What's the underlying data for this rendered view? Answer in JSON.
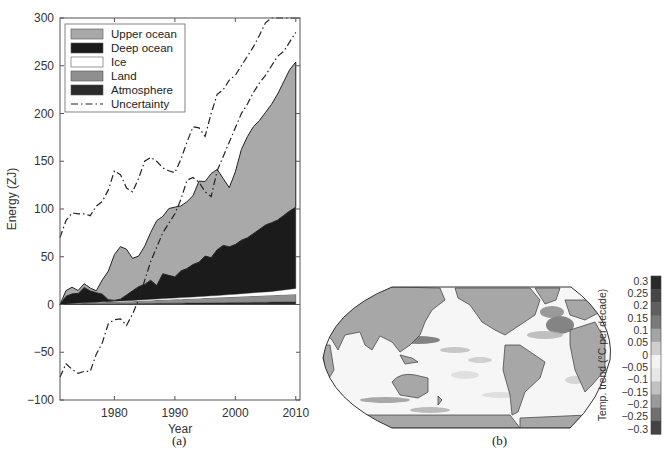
{
  "chart_data": [
    {
      "id": "a",
      "type": "area",
      "caption": "(a)",
      "title": "",
      "xlabel": "Year",
      "ylabel": "Energy (ZJ)",
      "xlim": [
        1971,
        2010.7
      ],
      "ylim": [
        -100,
        300
      ],
      "xticks": [
        1980,
        1990,
        2000,
        2010
      ],
      "yticks": [
        -100,
        -50,
        0,
        50,
        100,
        150,
        200,
        250,
        300
      ],
      "grid": false,
      "legend_position": "upper left",
      "legend": [
        "Upper ocean",
        "Deep ocean",
        "Ice",
        "Land",
        "Atmosphere",
        "Uncertainty"
      ],
      "x": [
        1971,
        1972,
        1973,
        1974,
        1975,
        1976,
        1977,
        1978,
        1979,
        1980,
        1981,
        1982,
        1983,
        1984,
        1985,
        1986,
        1987,
        1988,
        1989,
        1990,
        1991,
        1992,
        1993,
        1994,
        1995,
        1996,
        1997,
        1998,
        1999,
        2000,
        2001,
        2002,
        2003,
        2004,
        2005,
        2006,
        2007,
        2008,
        2009,
        2010
      ],
      "stacking": "cumulative (Atmosphere, Land, Ice, Deep ocean, Upper ocean from bottom)",
      "series": [
        {
          "name": "Atmosphere",
          "color": "#2a2a2a",
          "values": [
            0,
            0.2,
            0.3,
            0.4,
            0.4,
            0.5,
            0.5,
            0.6,
            0.6,
            0.7,
            0.8,
            0.8,
            0.9,
            1,
            1,
            1.1,
            1.2,
            1.3,
            1.3,
            1.4,
            1.4,
            1.5,
            1.5,
            1.6,
            1.7,
            1.8,
            1.8,
            1.9,
            2,
            2,
            2.1,
            2.2,
            2.3,
            2.3,
            2.4,
            2.5,
            2.5,
            2.6,
            2.7,
            2.8
          ]
        },
        {
          "name": "Land",
          "color": "#8f8f8f",
          "values": [
            0,
            0.3,
            0.6,
            0.9,
            1.1,
            1.3,
            1.5,
            1.7,
            1.9,
            2,
            2.2,
            2.4,
            2.6,
            2.8,
            3,
            3.2,
            3.4,
            3.6,
            3.8,
            4,
            4.2,
            4.4,
            4.6,
            4.8,
            5,
            5.2,
            5.4,
            5.6,
            5.8,
            6,
            6.2,
            6.4,
            6.6,
            6.8,
            7,
            7.2,
            7.4,
            7.6,
            7.8,
            8
          ]
        },
        {
          "name": "Ice",
          "color": "#ffffff",
          "values": [
            0,
            0.1,
            0.2,
            0.3,
            0.3,
            0.4,
            0.4,
            0.5,
            0.5,
            0.6,
            0.6,
            0.7,
            0.8,
            0.9,
            1,
            1.1,
            1.2,
            1.3,
            1.4,
            1.5,
            1.6,
            1.7,
            1.8,
            1.9,
            2,
            2.1,
            2.2,
            2.4,
            2.6,
            2.8,
            3,
            3.2,
            3.4,
            3.6,
            3.8,
            4,
            4.5,
            5,
            5.5,
            6
          ]
        },
        {
          "name": "Deep ocean",
          "color": "#1b1b1b",
          "values": [
            0,
            8,
            10,
            10,
            16,
            12,
            10,
            8,
            2,
            1,
            2,
            6,
            10,
            14,
            16,
            20,
            14,
            26,
            24,
            22,
            28,
            30,
            34,
            36,
            42,
            40,
            48,
            52,
            50,
            52,
            56,
            58,
            62,
            66,
            70,
            72,
            74,
            78,
            82,
            85
          ]
        },
        {
          "name": "Upper ocean",
          "color": "#a9a9a9",
          "values": [
            0,
            6,
            7,
            3,
            4,
            3,
            2,
            15,
            30,
            48,
            55,
            48,
            34,
            32,
            40,
            50,
            68,
            60,
            70,
            73,
            68,
            70,
            72,
            85,
            78,
            88,
            84,
            70,
            62,
            76,
            95,
            106,
            112,
            114,
            118,
            124,
            132,
            140,
            148,
            152
          ]
        },
        {
          "name": "Uncertainty (upper)",
          "style": "dash-dot",
          "color": "#222222",
          "values": [
            70,
            88,
            96,
            95,
            95,
            93,
            103,
            108,
            120,
            140,
            136,
            122,
            118,
            132,
            150,
            154,
            150,
            143,
            140,
            138,
            152,
            170,
            186,
            185,
            176,
            200,
            220,
            225,
            235,
            240,
            250,
            260,
            270,
            282,
            295,
            300,
            300,
            300,
            300,
            300
          ]
        },
        {
          "name": "Uncertainty (lower)",
          "style": "dash-dot",
          "color": "#222222",
          "values": [
            -76,
            -62,
            -68,
            -72,
            -70,
            -70,
            -52,
            -40,
            -20,
            -16,
            -15,
            -22,
            -10,
            5,
            25,
            45,
            60,
            75,
            85,
            95,
            110,
            130,
            133,
            128,
            118,
            113,
            140,
            155,
            170,
            185,
            200,
            210,
            222,
            232,
            240,
            250,
            260,
            265,
            275,
            285
          ]
        }
      ]
    },
    {
      "id": "b",
      "type": "heatmap",
      "caption": "(b)",
      "title": "",
      "projection": "Robinson, Pacific-centred",
      "colorbar": {
        "label": "Temp. trend (°C per decade)",
        "ticks": [
          "0.3",
          "0.25",
          "0.2",
          "0.15",
          "0.1",
          "0.05",
          "0",
          "−0.05",
          "−0.1",
          "−0.15",
          "−0.2",
          "−0.25",
          "−0.3"
        ],
        "range": [
          -0.3,
          0.3
        ]
      },
      "annotations": [
        "strongest warming: North Atlantic subpolar gyre",
        "warming band: Kuroshio extension (NW Pacific)",
        "cooling bands: Southern Ocean"
      ]
    }
  ],
  "captions": {
    "a": "(a)",
    "b": "(b)"
  }
}
